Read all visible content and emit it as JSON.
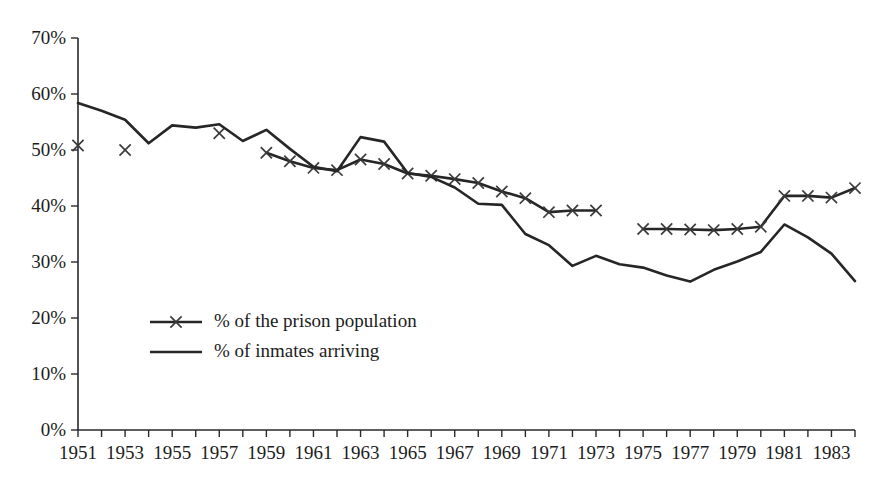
{
  "chart_data": {
    "type": "line",
    "title": "",
    "xlabel": "",
    "ylabel": "",
    "xlim": [
      1951,
      1984
    ],
    "ylim": [
      0,
      70
    ],
    "grid": false,
    "legend_position": "inside-lower-left",
    "y_ticks": [
      0,
      10,
      20,
      30,
      40,
      50,
      60,
      70
    ],
    "y_tick_labels": [
      "0%",
      "10%",
      "20%",
      "30%",
      "40%",
      "50%",
      "60%",
      "70%"
    ],
    "x_tick_values": [
      1951,
      1952,
      1953,
      1954,
      1955,
      1956,
      1957,
      1958,
      1959,
      1960,
      1961,
      1962,
      1963,
      1964,
      1965,
      1966,
      1967,
      1968,
      1969,
      1970,
      1971,
      1972,
      1973,
      1974,
      1975,
      1976,
      1977,
      1978,
      1979,
      1980,
      1981,
      1982,
      1983,
      1984
    ],
    "x_tick_labels": [
      "1951",
      "1953",
      "1955",
      "1957",
      "1959",
      "1961",
      "1963",
      "1965",
      "1967",
      "1969",
      "1971",
      "1973",
      "1975",
      "1977",
      "1979",
      "1981",
      "1983"
    ],
    "x_tick_label_values": [
      1951,
      1953,
      1955,
      1957,
      1959,
      1961,
      1963,
      1965,
      1967,
      1969,
      1971,
      1973,
      1975,
      1977,
      1979,
      1981,
      1983
    ],
    "series": [
      {
        "name": "% of the prison population",
        "marker": "x",
        "style": "line-with-x-markers",
        "color": "#262626",
        "segments": [
          {
            "points": [
              [
                1951,
                50.8
              ]
            ]
          },
          {
            "points": [
              [
                1953,
                50.0
              ]
            ]
          },
          {
            "points": [
              [
                1957,
                53.0
              ]
            ]
          },
          {
            "points": [
              [
                1959,
                49.5
              ],
              [
                1960,
                48.0
              ],
              [
                1961,
                46.8
              ],
              [
                1962,
                46.4
              ],
              [
                1963,
                48.3
              ],
              [
                1964,
                47.5
              ],
              [
                1965,
                45.8
              ],
              [
                1966,
                45.4
              ],
              [
                1967,
                44.8
              ],
              [
                1968,
                44.1
              ],
              [
                1969,
                42.6
              ],
              [
                1970,
                41.4
              ],
              [
                1971,
                38.9
              ],
              [
                1972,
                39.2
              ],
              [
                1973,
                39.2
              ]
            ]
          },
          {
            "points": [
              [
                1975,
                35.9
              ],
              [
                1976,
                35.9
              ],
              [
                1977,
                35.8
              ],
              [
                1978,
                35.7
              ],
              [
                1979,
                35.9
              ],
              [
                1980,
                36.3
              ],
              [
                1981,
                41.8
              ],
              [
                1982,
                41.8
              ],
              [
                1983,
                41.5
              ],
              [
                1984,
                43.2
              ]
            ]
          }
        ]
      },
      {
        "name": "% of inmates arriving",
        "marker": "none",
        "style": "plain-line",
        "color": "#262626",
        "segments": [
          {
            "points": [
              [
                1951,
                58.4
              ],
              [
                1952,
                57.0
              ],
              [
                1953,
                55.4
              ],
              [
                1954,
                51.2
              ],
              [
                1955,
                54.4
              ],
              [
                1956,
                54.0
              ],
              [
                1957,
                54.6
              ],
              [
                1958,
                51.6
              ],
              [
                1959,
                53.6
              ],
              [
                1960,
                50.2
              ],
              [
                1961,
                47.0
              ],
              [
                1962,
                46.2
              ],
              [
                1963,
                52.3
              ],
              [
                1964,
                51.5
              ],
              [
                1965,
                45.9
              ],
              [
                1966,
                45.2
              ],
              [
                1967,
                43.3
              ],
              [
                1968,
                40.4
              ],
              [
                1969,
                40.2
              ],
              [
                1970,
                35.0
              ],
              [
                1971,
                33.0
              ],
              [
                1972,
                29.3
              ],
              [
                1973,
                31.1
              ],
              [
                1974,
                29.6
              ],
              [
                1975,
                29.0
              ],
              [
                1976,
                27.6
              ],
              [
                1977,
                26.5
              ],
              [
                1978,
                28.6
              ],
              [
                1979,
                30.1
              ],
              [
                1980,
                31.8
              ],
              [
                1981,
                36.7
              ],
              [
                1982,
                34.4
              ],
              [
                1983,
                31.5
              ],
              [
                1984,
                26.6
              ]
            ]
          }
        ]
      }
    ],
    "legend_entries": [
      {
        "label": "% of the prison population",
        "marker": "x"
      },
      {
        "label": "% of inmates arriving",
        "marker": "none"
      }
    ]
  }
}
